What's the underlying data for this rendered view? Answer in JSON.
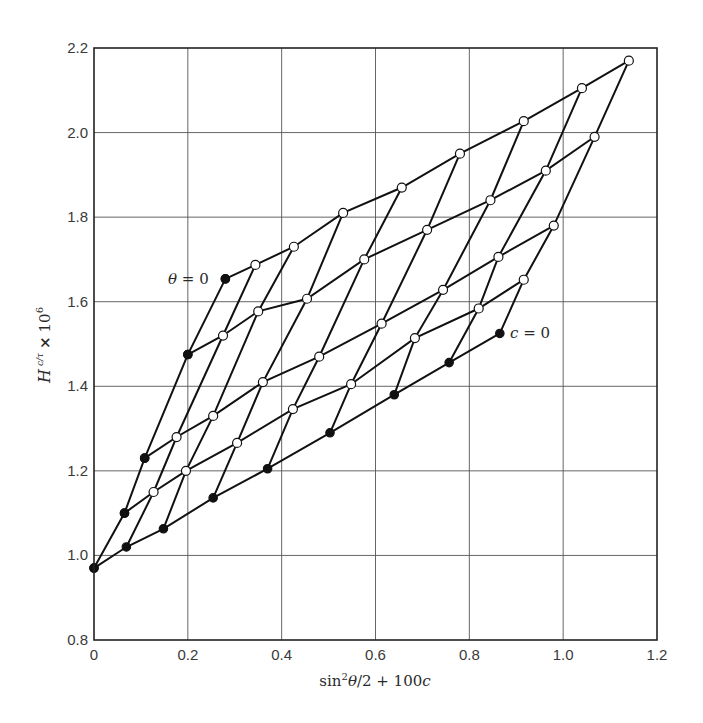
{
  "chart_data": {
    "type": "line",
    "title": "",
    "xlabel": "sin²θ/2 + 100c",
    "ylabel": "H c/τ × 10⁶",
    "xlim": [
      0,
      1.2
    ],
    "ylim": [
      0.8,
      2.2
    ],
    "x_ticks": [
      "0",
      "0.2",
      "0.4",
      "0.6",
      "0.8",
      "1.0",
      "1.2"
    ],
    "y_ticks": [
      "0.8",
      "1.0",
      "1.2",
      "1.4",
      "1.6",
      "1.8",
      "2.0",
      "2.2"
    ],
    "grid": true,
    "annotations": [
      {
        "text": "θ = 0",
        "x": 0.28,
        "y": 1.654
      },
      {
        "text": "c = 0",
        "x": 0.865,
        "y": 1.525
      }
    ],
    "note": "Zimm-type grid plot: rows are lines of constant concentration c, columns are lines of constant angle θ. Filled markers are extrapolated (θ = 0 and c = 0) points; open markers are measured data.",
    "series": [
      {
        "name": "c4 (highest c)",
        "marker": "open",
        "x": [
          0.28,
          0.344,
          0.426,
          0.531,
          0.656,
          0.78,
          0.916,
          1.04,
          1.14
        ],
        "y": [
          1.654,
          1.687,
          1.73,
          1.81,
          1.87,
          1.95,
          2.027,
          2.105,
          2.17
        ]
      },
      {
        "name": "c3",
        "marker": "open",
        "x": [
          0.2,
          0.275,
          0.35,
          0.454,
          0.576,
          0.71,
          0.845,
          0.963,
          1.067
        ],
        "y": [
          1.475,
          1.52,
          1.577,
          1.607,
          1.7,
          1.77,
          1.84,
          1.91,
          1.99
        ]
      },
      {
        "name": "c2",
        "marker": "open",
        "x": [
          0.108,
          0.176,
          0.254,
          0.36,
          0.48,
          0.613,
          0.744,
          0.862,
          0.98
        ],
        "y": [
          1.23,
          1.28,
          1.33,
          1.41,
          1.47,
          1.548,
          1.628,
          1.706,
          1.78
        ]
      },
      {
        "name": "c1",
        "marker": "open",
        "x": [
          0.065,
          0.127,
          0.196,
          0.305,
          0.424,
          0.548,
          0.684,
          0.82,
          0.916
        ],
        "y": [
          1.1,
          1.15,
          1.2,
          1.266,
          1.346,
          1.405,
          1.514,
          1.584,
          1.652
        ]
      },
      {
        "name": "c = 0",
        "marker": "filled",
        "x": [
          0,
          0.069,
          0.148,
          0.254,
          0.37,
          0.503,
          0.64,
          0.757,
          0.865
        ],
        "y": [
          0.97,
          1.02,
          1.063,
          1.136,
          1.205,
          1.29,
          1.38,
          1.456,
          1.525
        ]
      },
      {
        "name": "θ = 0",
        "marker": "filled",
        "x": [
          0,
          0.065,
          0.108,
          0.2,
          0.28
        ],
        "y": [
          0.97,
          1.1,
          1.23,
          1.475,
          1.654
        ]
      }
    ]
  }
}
